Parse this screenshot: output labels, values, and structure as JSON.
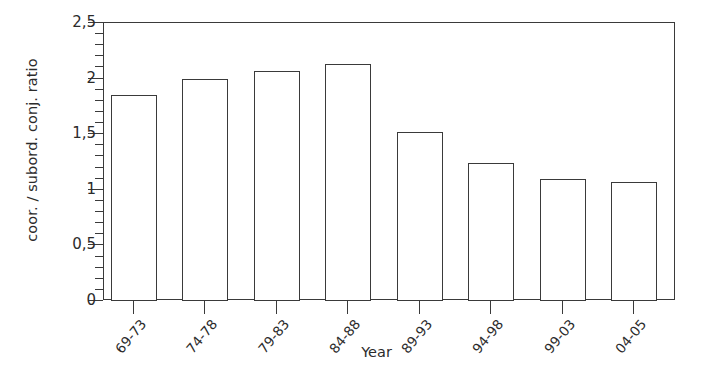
{
  "chart_data": {
    "type": "bar",
    "title": "",
    "subtitle": "",
    "xlabel": "Year",
    "ylabel": "coor. / subord. conj. ratio",
    "categories": [
      "69-73",
      "74-78",
      "79-83",
      "84-88",
      "89-93",
      "94-98",
      "99-03",
      "04-05"
    ],
    "values": [
      1.85,
      2.0,
      2.07,
      2.13,
      1.52,
      1.24,
      1.1,
      1.07
    ],
    "series": [
      {
        "name": "coor. / subord. conj. ratio",
        "values": [
          1.85,
          2.0,
          2.07,
          2.13,
          1.52,
          1.24,
          1.1,
          1.07
        ]
      }
    ],
    "ylim": [
      0,
      2.5
    ],
    "ytick_labels": [
      "0",
      "0,5",
      "1",
      "1,5",
      "2",
      "2,5"
    ],
    "ytick_values": [
      0,
      0.5,
      1,
      1.5,
      2,
      2.5
    ],
    "yminor_step": 0.1,
    "grid": false,
    "legend": false,
    "legend_position": "none",
    "bar_fill_color": "#ffffff",
    "bar_edge_color": "#3a3a3a",
    "background_color": "#ffffff",
    "axis_color": "#3a3a3a",
    "text_color": "#2b2b2b",
    "xtick_label_rotation_deg": -50
  }
}
